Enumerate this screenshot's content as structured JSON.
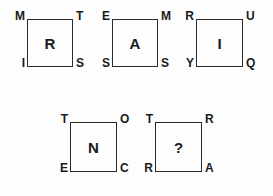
{
  "figure": {
    "type": "letter-square-logic-puzzle",
    "background_color": "#fdfdfd",
    "line_color": "#2b2b2b",
    "text_color": "#1a1a1a",
    "rows": [
      {
        "name": "top-row",
        "cell_count": 3
      },
      {
        "name": "bottom-row",
        "cell_count": 2
      }
    ]
  },
  "cells": [
    {
      "id": "cell-1",
      "row": "top-row",
      "position": 1,
      "center": "R",
      "corners": {
        "top_left": "M",
        "top_right": "T",
        "bottom_left": "I",
        "bottom_right": "S"
      },
      "is_answer": false
    },
    {
      "id": "cell-2",
      "row": "top-row",
      "position": 2,
      "center": "A",
      "corners": {
        "top_left": "E",
        "top_right": "M",
        "bottom_left": "S",
        "bottom_right": "S"
      },
      "is_answer": false
    },
    {
      "id": "cell-3",
      "row": "top-row",
      "position": 3,
      "center": "I",
      "corners": {
        "top_left": "R",
        "top_right": "U",
        "bottom_left": "Y",
        "bottom_right": "Q"
      },
      "is_answer": false
    },
    {
      "id": "cell-4",
      "row": "bottom-row",
      "position": 1,
      "center": "N",
      "corners": {
        "top_left": "T",
        "top_right": "O",
        "bottom_left": "E",
        "bottom_right": "C"
      },
      "is_answer": false
    },
    {
      "id": "cell-5",
      "row": "bottom-row",
      "position": 2,
      "center": "?",
      "corners": {
        "top_left": "T",
        "top_right": "R",
        "bottom_left": "R",
        "bottom_right": "A"
      },
      "is_answer": true
    }
  ],
  "geometry": [
    {
      "id": "cell-1",
      "x": 27,
      "y": 19,
      "w": 46,
      "h": 48
    },
    {
      "id": "cell-2",
      "x": 112,
      "y": 19,
      "w": 46,
      "h": 48
    },
    {
      "id": "cell-3",
      "x": 196,
      "y": 19,
      "w": 47,
      "h": 48
    },
    {
      "id": "cell-4",
      "x": 70,
      "y": 122,
      "w": 47,
      "h": 50
    },
    {
      "id": "cell-5",
      "x": 155,
      "y": 122,
      "w": 47,
      "h": 50
    }
  ]
}
